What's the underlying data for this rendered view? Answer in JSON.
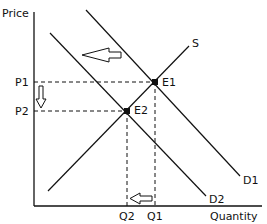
{
  "axes": {
    "y_label": "Price",
    "x_label": "Quantity"
  },
  "curves": {
    "supply": "S",
    "demand_initial": "D1",
    "demand_new": "D2"
  },
  "points": {
    "equilibrium_initial": "E1",
    "equilibrium_new": "E2"
  },
  "price_levels": {
    "p1": "P1",
    "p2": "P2"
  },
  "quantity_levels": {
    "q1": "Q1",
    "q2": "Q2"
  },
  "arrows": {
    "demand_shift": "left",
    "price_change": "down",
    "quantity_change": "left"
  },
  "colors": {
    "line": "#111111",
    "background": "#ffffff"
  }
}
